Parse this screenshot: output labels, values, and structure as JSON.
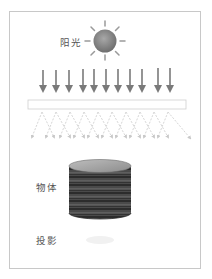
{
  "diagram": {
    "labels": {
      "sunlight": "阳光",
      "object": "物体",
      "projection": "投影"
    },
    "colors": {
      "frame_border": "#c8c8c8",
      "sun_fill": "#8a8a8a",
      "sun_rays": "#9a9a9a",
      "arrow": "#7a7a7a",
      "diffuser_border": "#cfcfcf",
      "scattered_rays": "#d6d6d6",
      "cylinder_top": "#9c9c9c",
      "cylinder_body": "#3e3e3e",
      "shadow": "#f1f1f1",
      "label_text": "#555555"
    },
    "incident_arrow_count": 11,
    "elements": [
      "sun",
      "incident-arrows",
      "diffuser-plate",
      "scattered-rays",
      "cylinder-object",
      "projection-shadow"
    ]
  }
}
